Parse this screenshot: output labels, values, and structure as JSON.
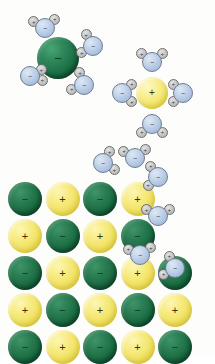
{
  "figure": {
    "canvas": {
      "width": 215,
      "height": 356
    },
    "background_color": "#fdfdfb"
  },
  "legend": {
    "anion_symbol": "−",
    "cation_symbol": "+",
    "water_oxygen_symbol": "−",
    "water_hydrogen_symbol": "+"
  },
  "colors": {
    "anion_green": "#14663d",
    "cation_yellow": "#f2e45e",
    "water_oxygen_blue": "#b0c4de",
    "water_hydrogen_gray": "#c9c9c9",
    "outline_dark": "#6c7d93",
    "background": "#ffffff"
  },
  "solvated_anion": {
    "label": "hydrated anion",
    "ion": {
      "charge": "−",
      "type": "anion",
      "cx": 58,
      "cy": 58,
      "r": 21
    },
    "waters": [
      {
        "cx": 45,
        "cy": 28,
        "h1": 210,
        "h2": 318
      },
      {
        "cx": 93,
        "cy": 46,
        "h1": 150,
        "h2": 238
      },
      {
        "cx": 30,
        "cy": 76,
        "h1": 20,
        "h2": 330
      },
      {
        "cx": 84,
        "cy": 85,
        "h1": 160,
        "h2": 252
      }
    ]
  },
  "solvated_cation": {
    "label": "hydrated cation",
    "ion": {
      "charge": "+",
      "type": "cation",
      "cx": 152,
      "cy": 93,
      "r": 16
    },
    "waters": [
      {
        "cx": 152,
        "cy": 62,
        "h1": 218,
        "h2": 322
      },
      {
        "cx": 122,
        "cy": 93,
        "h1": 42,
        "h2": 318
      },
      {
        "cx": 183,
        "cy": 93,
        "h1": 138,
        "h2": 222
      },
      {
        "cx": 152,
        "cy": 124,
        "h1": 38,
        "h2": 142
      }
    ]
  },
  "crystal_lattice": {
    "label": "ionic crystal lattice",
    "origin": {
      "x": 8,
      "y": 182
    },
    "spacing": {
      "x": 37.5,
      "y": 37
    },
    "ion_radius": 17,
    "rows": [
      {
        "index": 0,
        "ions": [
          "−",
          "+",
          "−",
          "+"
        ]
      },
      {
        "index": 1,
        "ions": [
          "+",
          "−",
          "+",
          "−"
        ]
      },
      {
        "index": 2,
        "ions": [
          "−",
          "+",
          "−",
          "+",
          "−"
        ]
      },
      {
        "index": 3,
        "ions": [
          "+",
          "−",
          "+",
          "−",
          "+"
        ]
      },
      {
        "index": 4,
        "ions": [
          "−",
          "+",
          "−",
          "+",
          "−"
        ]
      }
    ]
  },
  "detaching_waters": {
    "label": "water molecules detaching from crystal edge",
    "items": [
      {
        "cx": 103,
        "cy": 163,
        "h1": 30,
        "h2": 300
      },
      {
        "cx": 135,
        "cy": 158,
        "h1": 212,
        "h2": 322
      },
      {
        "cx": 158,
        "cy": 177,
        "h1": 140,
        "h2": 236
      },
      {
        "cx": 158,
        "cy": 216,
        "h1": 208,
        "h2": 330
      },
      {
        "cx": 140,
        "cy": 255,
        "h1": 206,
        "h2": 326
      },
      {
        "cx": 175,
        "cy": 268,
        "h1": 152,
        "h2": 244
      }
    ]
  }
}
